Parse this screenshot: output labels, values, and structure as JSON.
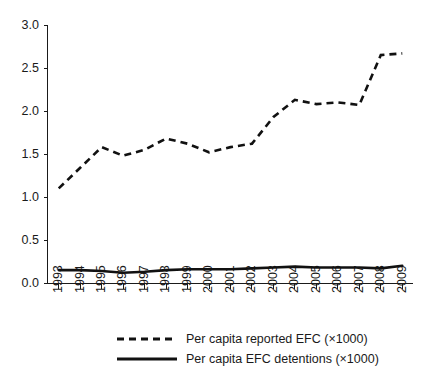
{
  "chart_data": {
    "type": "line",
    "title": "",
    "xlabel": "",
    "ylabel": "",
    "x": [
      1993,
      1994,
      1995,
      1996,
      1997,
      1998,
      1999,
      2000,
      2001,
      2002,
      2003,
      2004,
      2005,
      2006,
      2007,
      2008,
      2009
    ],
    "categories": [
      "1993",
      "1994",
      "1995",
      "1996",
      "1997",
      "1998",
      "1999",
      "2000",
      "2001",
      "2002",
      "2003",
      "2004",
      "2005",
      "2006",
      "2007",
      "2008",
      "2009"
    ],
    "series": [
      {
        "name": "Per capita reported EFC (×1000)",
        "style": "dashed",
        "color": "#111111",
        "values": [
          1.1,
          1.34,
          1.58,
          1.48,
          1.55,
          1.68,
          1.62,
          1.52,
          1.58,
          1.62,
          1.93,
          2.13,
          2.08,
          2.1,
          2.07,
          2.65,
          2.67
        ]
      },
      {
        "name": "Per capita EFC detentions (×1000)",
        "style": "solid",
        "color": "#111111",
        "values": [
          0.15,
          0.15,
          0.14,
          0.12,
          0.13,
          0.15,
          0.16,
          0.16,
          0.16,
          0.17,
          0.18,
          0.19,
          0.18,
          0.18,
          0.18,
          0.17,
          0.2
        ]
      }
    ],
    "ylim": [
      0.0,
      3.0
    ],
    "yticks": [
      0.0,
      0.5,
      1.0,
      1.5,
      2.0,
      2.5,
      3.0
    ],
    "ytick_labels": [
      "0.0",
      "0.5",
      "1.0",
      "1.5",
      "2.0",
      "2.5",
      "3.0"
    ],
    "grid": false,
    "legend_position": "bottom"
  },
  "legend": {
    "items": [
      {
        "label": "Per capita reported EFC (×1000)",
        "style": "dashed"
      },
      {
        "label": "Per capita EFC detentions (×1000)",
        "style": "solid"
      }
    ]
  }
}
